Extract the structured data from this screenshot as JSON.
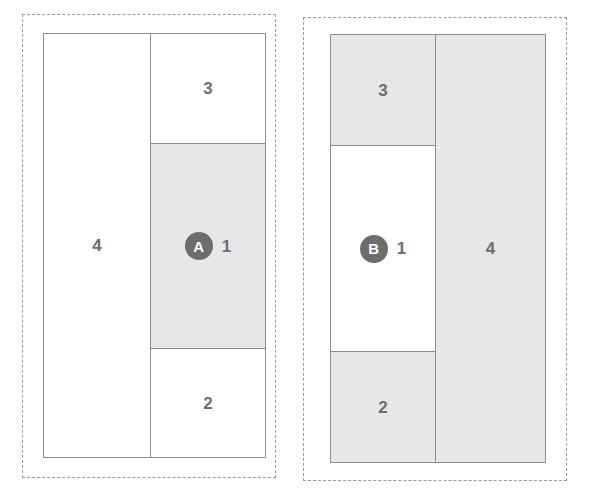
{
  "top_fragment": "· · ·",
  "colors": {
    "shaded_fill": "#e6e7e6",
    "plain_fill": "#ffffff",
    "stroke": "#8e8e8e",
    "dashed_stroke": "#9a9a9a",
    "label_text": "#6d6d6d",
    "badge_fill": "#6d6d6d",
    "badge_text": "#ffffff"
  },
  "panels": [
    {
      "id": "A",
      "badge": "A",
      "regions": {
        "r1": {
          "label": "1",
          "shaded": true
        },
        "r2": {
          "label": "2",
          "shaded": false
        },
        "r3": {
          "label": "3",
          "shaded": false
        },
        "r4": {
          "label": "4",
          "shaded": false
        }
      }
    },
    {
      "id": "B",
      "badge": "B",
      "regions": {
        "r1": {
          "label": "1",
          "shaded": false
        },
        "r2": {
          "label": "2",
          "shaded": true
        },
        "r3": {
          "label": "3",
          "shaded": true
        },
        "r4": {
          "label": "4",
          "shaded": true
        }
      }
    }
  ]
}
